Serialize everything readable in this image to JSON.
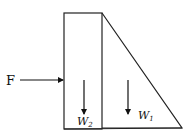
{
  "diagram": {
    "type": "force-diagram",
    "bodies": [
      {
        "name": "rectangle-block",
        "label": "W2"
      },
      {
        "name": "triangle-block",
        "label": "W1"
      }
    ],
    "force": {
      "label": "F",
      "direction": "right"
    },
    "weights": [
      {
        "symbol": "W",
        "subscript": "2",
        "direction": "down"
      },
      {
        "symbol": "W",
        "subscript": "1",
        "direction": "down"
      }
    ]
  },
  "labels": {
    "force": "F",
    "w2_main": "W",
    "w2_sub": "2",
    "w1_main": "W",
    "w1_sub": "1"
  },
  "colors": {
    "stroke": "#222222",
    "background": "#ffffff"
  }
}
